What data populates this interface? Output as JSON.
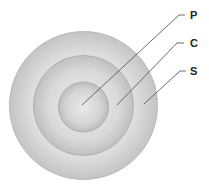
{
  "diagram": {
    "type": "concentric-circles",
    "center": {
      "x": 83.5,
      "y": 105.5
    },
    "rings": [
      {
        "id": "S",
        "label": "S",
        "radius": 74,
        "role": "outer"
      },
      {
        "id": "C",
        "label": "C",
        "radius": 50,
        "role": "middle"
      },
      {
        "id": "P",
        "label": "P",
        "radius": 25,
        "role": "inner"
      }
    ],
    "labels": [
      {
        "text": "P",
        "x": 190,
        "y": 19
      },
      {
        "text": "C",
        "x": 190,
        "y": 47
      },
      {
        "text": "S",
        "x": 190,
        "y": 75
      }
    ],
    "colors": {
      "fill_light": "#ececec",
      "fill_dark": "#bcbcbc",
      "outline": "#a8a8a8",
      "leader_line": "#5a5a5a",
      "label_text": "#222222"
    }
  }
}
